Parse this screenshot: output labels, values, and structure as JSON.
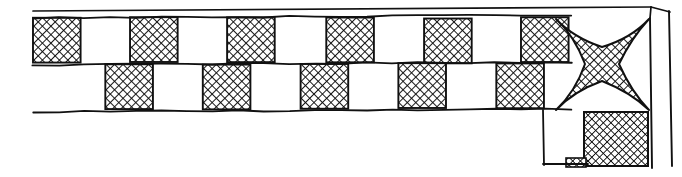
{
  "figure": {
    "title": "Checkerboard border frieze with corner star ornament",
    "type": "line-art-illustration",
    "medium": "pen-and-ink engraving",
    "width": 682,
    "height": 177,
    "background_color": "#ffffff",
    "ink_color": "#111111"
  },
  "style": {
    "ink_color": "#111111",
    "paper_color": "#ffffff",
    "hatch_color": "#0d0d0d",
    "hatch_spacing_px": 6,
    "hatch_angle_deg": 45,
    "hatch_stroke_width": 1.6,
    "outline_stroke_width": 2.0,
    "frame_stroke_width": 1.6,
    "thin_rule_stroke_width": 1.4
  },
  "frame": {
    "label": "Outer frame rules",
    "top_rule": {
      "x1": 33,
      "y1": 11,
      "x2": 651,
      "y2": 7,
      "name": "top-outer-rule"
    },
    "right_outer_rule": {
      "x1": 669,
      "y1": 11,
      "x2": 672,
      "y2": 166,
      "name": "right-outer-rule"
    },
    "right_inner_rule": {
      "x1": 650,
      "y1": 18,
      "x2": 652,
      "y2": 168,
      "name": "right-inner-rule"
    },
    "corner_diagonal": {
      "x1": 651,
      "y1": 7,
      "x2": 670,
      "y2": 12,
      "name": "corner-bevel"
    },
    "corner_diagonal_inner": {
      "x1": 651,
      "y1": 7,
      "x2": 650,
      "y2": 18,
      "name": "corner-bevel-inner"
    }
  },
  "band": {
    "label": "Checkerboard band",
    "left_x": 33,
    "right_x": 570,
    "top_y": 18,
    "mid_y": 64,
    "bottom_y": 110,
    "cell_width": 48.8,
    "row_height": 46,
    "rows": [
      {
        "name": "upper-row",
        "y_top": 18,
        "y_bottom": 64,
        "offset_x": 0,
        "count": 11,
        "pattern": [
          "hatched",
          "blank",
          "hatched",
          "blank",
          "hatched",
          "blank",
          "hatched",
          "blank",
          "hatched",
          "blank",
          "hatched"
        ]
      },
      {
        "name": "lower-row",
        "y_top": 64,
        "y_bottom": 110,
        "offset_x": 24.4,
        "count": 11,
        "pattern": [
          "blank",
          "hatched",
          "blank",
          "hatched",
          "blank",
          "hatched",
          "blank",
          "hatched",
          "blank",
          "hatched",
          "blank"
        ]
      }
    ],
    "top_edge_rule": {
      "x1": 33,
      "y1": 18,
      "x2": 572,
      "y2": 15,
      "name": "band-top-rule"
    },
    "mid_edge_rule": {
      "x1": 33,
      "y1": 65,
      "x2": 572,
      "y2": 62,
      "name": "band-mid-rule"
    },
    "bottom_edge_rule": {
      "x1": 33,
      "y1": 112,
      "x2": 572,
      "y2": 109,
      "name": "band-bottom-rule"
    }
  },
  "corner_ornament": {
    "label": "Four-pointed concave star",
    "name": "four-pointed-star",
    "fill": "cross-hatched",
    "center_x": 602,
    "center_y": 64,
    "left_x": 556,
    "right_x": 649,
    "top_y": 19,
    "bottom_y": 110,
    "waist": 17,
    "points": 4,
    "concavity": 0.72
  },
  "corner_square": {
    "label": "Small cross-hatched square below star",
    "name": "corner-hatched-square",
    "x": 584,
    "y": 112,
    "width": 64,
    "height": 54,
    "fill": "cross-hatched"
  },
  "corner_tab": {
    "label": "Small hatched tab at lower left of corner square",
    "name": "corner-hatched-tab",
    "x": 566,
    "y": 158,
    "width": 20,
    "height": 9,
    "fill": "cross-hatched"
  },
  "corner_uprights": {
    "label": "Vertical rules descending from band into corner",
    "left_upright": {
      "x1": 543,
      "y1": 110,
      "x2": 544,
      "y2": 165,
      "name": "left-upright-rule"
    },
    "base_rule": {
      "x1": 543,
      "y1": 164,
      "x2": 588,
      "y2": 164,
      "name": "base-rule"
    }
  }
}
